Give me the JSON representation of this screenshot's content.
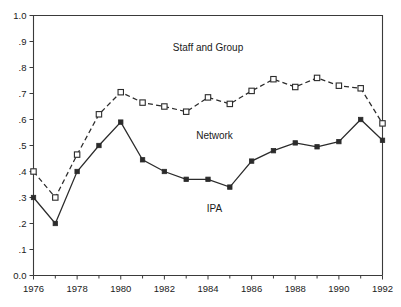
{
  "chart_data": {
    "type": "line",
    "title": "",
    "subtitle": "",
    "xlabel": "",
    "ylabel": "",
    "xlim": [
      1976,
      1992
    ],
    "ylim": [
      0.0,
      1.0
    ],
    "grid": false,
    "legend_position": "inline-annotations",
    "x": [
      1976,
      1977,
      1978,
      1979,
      1980,
      1981,
      1982,
      1983,
      1984,
      1985,
      1986,
      1987,
      1988,
      1989,
      1990,
      1991,
      1992
    ],
    "xtick_labels": [
      "1976",
      "1978",
      "1980",
      "1982",
      "1984",
      "1986",
      "1988",
      "1990",
      "1992"
    ],
    "xtick_values": [
      1976,
      1978,
      1980,
      1982,
      1984,
      1986,
      1988,
      1990,
      1992
    ],
    "xtick_minor_values": [
      1977,
      1979,
      1981,
      1983,
      1985,
      1987,
      1989,
      1991
    ],
    "ytick_labels": [
      "1.0",
      ".9",
      ".8",
      ".7",
      ".6",
      ".5",
      ".4",
      ".3",
      ".2",
      ".1",
      "0.0"
    ],
    "ytick_values": [
      1.0,
      0.9,
      0.8,
      0.7,
      0.6,
      0.5,
      0.4,
      0.3,
      0.2,
      0.1,
      0.0
    ],
    "series": [
      {
        "name": "Staff and Group",
        "marker": "open-square",
        "line_style": "dashed",
        "color": "#2b2b2b",
        "values": [
          0.4,
          0.3,
          0.465,
          0.62,
          0.705,
          0.665,
          0.65,
          0.63,
          0.685,
          0.66,
          0.71,
          0.755,
          0.725,
          0.76,
          0.73,
          0.72,
          0.585
        ]
      },
      {
        "name": "IPA",
        "marker": "filled-square",
        "line_style": "solid",
        "color": "#2b2b2b",
        "values": [
          0.3,
          0.2,
          0.4,
          0.5,
          0.59,
          0.445,
          0.4,
          0.37,
          0.37,
          0.34,
          0.44,
          0.48,
          0.51,
          0.495,
          0.515,
          0.6,
          0.52
        ]
      }
    ],
    "annotations": [
      {
        "text": "Staff and Group",
        "x": 1984,
        "y": 0.865
      },
      {
        "text": "Network",
        "x": 1984.3,
        "y": 0.525
      },
      {
        "text": "IPA",
        "x": 1984.3,
        "y": 0.245
      }
    ]
  }
}
